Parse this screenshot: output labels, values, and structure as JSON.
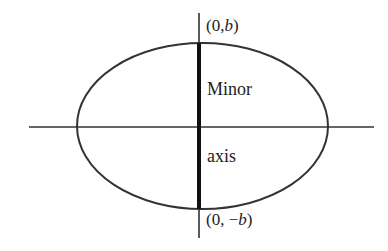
{
  "diagram": {
    "type": "ellipse-minor-axis",
    "labels": {
      "top_point": {
        "prefix": "(0,",
        "var": "b",
        "suffix": ")"
      },
      "bottom_point": {
        "prefix": "(0, −",
        "var": "b",
        "suffix": ")"
      },
      "axis_word_1": "Minor",
      "axis_word_2": "axis"
    },
    "colors": {
      "stroke": "#333333",
      "text": "#222222",
      "background": "#ffffff"
    }
  }
}
